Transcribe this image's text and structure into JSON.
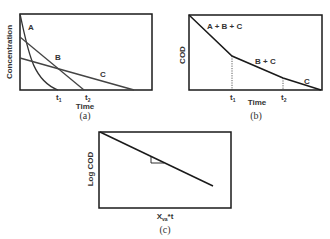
{
  "panels": {
    "a": {
      "caption": "(a)",
      "ylabel": "Concentration",
      "xlabel": "Time",
      "ticks": [
        {
          "base": "t",
          "sub": "1"
        },
        {
          "base": "t",
          "sub": "2"
        }
      ],
      "curves": [
        {
          "name": "A",
          "label": "A",
          "shape": "exponential decay, steep"
        },
        {
          "name": "B",
          "label": "B",
          "shape": "linear decline"
        },
        {
          "name": "C",
          "label": "C",
          "shape": "linear decline, shallow"
        }
      ]
    },
    "b": {
      "caption": "(b)",
      "ylabel": "COD",
      "xlabel": "Time",
      "ticks": [
        {
          "base": "t",
          "sub": "1"
        },
        {
          "base": "t",
          "sub": "2"
        }
      ],
      "segments": [
        {
          "label": "A + B + C"
        },
        {
          "label": "B + C"
        },
        {
          "label": "C"
        }
      ]
    },
    "c": {
      "caption": "(c)",
      "ylabel": "Log COD",
      "xlabel_base": "X",
      "xlabel_sub": "va",
      "xlabel_suffix": "*t",
      "line": "linear decline with slope triangle"
    }
  },
  "colors": {
    "axis": "#1a1a1a",
    "line": "#1a1a1a",
    "line_gray": "#555555",
    "text": "#333333"
  }
}
